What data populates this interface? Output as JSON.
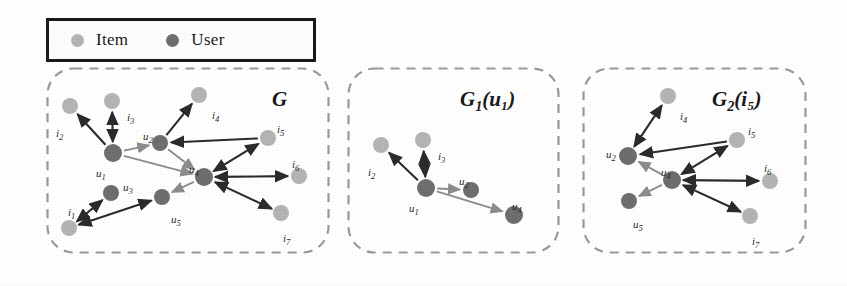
{
  "figure": {
    "type": "graph-diagram",
    "background": "#ffffff",
    "colors": {
      "item_node": "#b4b4b4",
      "user_node": "#6e6e6e",
      "edge": "#2b2b2b",
      "edge_light": "#8d8d8d",
      "panel_border": "#9a9a9a",
      "legend_border": "#1a1a1a",
      "text": "#1a1a1a"
    }
  },
  "legend": {
    "box": {
      "x": 46,
      "y": 18,
      "w": 270,
      "h": 44
    },
    "items": [
      {
        "label": "Item",
        "color_role": "item_node",
        "icon": "circle-icon",
        "dot_color": "#b4b4b4"
      },
      {
        "label": "User",
        "color_role": "user_node",
        "icon": "circle-icon",
        "dot_color": "#6e6e6e"
      }
    ]
  },
  "panels": [
    {
      "id": "panel-g",
      "title": {
        "main": "G",
        "sub": "",
        "paren": ""
      },
      "title_pos": {
        "x": 272,
        "y": 89,
        "size": 21
      },
      "box": {
        "x": 47,
        "y": 68,
        "w": 281,
        "h": 184
      },
      "nodes": [
        {
          "id": "i2",
          "type": "item",
          "label": "i",
          "sub": "2",
          "cx": 70,
          "cy": 106,
          "r": 8,
          "lx": 56,
          "ly": 128
        },
        {
          "id": "i3",
          "type": "item",
          "label": "i",
          "sub": "3",
          "cx": 112,
          "cy": 101,
          "r": 8,
          "lx": 127,
          "ly": 112
        },
        {
          "id": "i4",
          "type": "item",
          "label": "i",
          "sub": "4",
          "cx": 199,
          "cy": 95,
          "r": 8,
          "lx": 212,
          "ly": 110
        },
        {
          "id": "i5",
          "type": "item",
          "label": "i",
          "sub": "5",
          "cx": 268,
          "cy": 138,
          "r": 8,
          "lx": 277,
          "ly": 124
        },
        {
          "id": "i6",
          "type": "item",
          "label": "i",
          "sub": "6",
          "cx": 299,
          "cy": 176,
          "r": 8,
          "lx": 292,
          "ly": 159
        },
        {
          "id": "i7",
          "type": "item",
          "label": "i",
          "sub": "7",
          "cx": 281,
          "cy": 213,
          "r": 8,
          "lx": 283,
          "ly": 233
        },
        {
          "id": "i1",
          "type": "item",
          "label": "i",
          "sub": "1",
          "cx": 69,
          "cy": 228,
          "r": 8,
          "lx": 68,
          "ly": 207
        },
        {
          "id": "u1",
          "type": "user",
          "label": "u",
          "sub": "1",
          "cx": 113,
          "cy": 153,
          "r": 9,
          "lx": 96,
          "ly": 168
        },
        {
          "id": "u2",
          "type": "user",
          "label": "u",
          "sub": "2",
          "cx": 160,
          "cy": 143,
          "r": 8,
          "lx": 143,
          "ly": 131
        },
        {
          "id": "u3",
          "type": "user",
          "label": "u",
          "sub": "3",
          "cx": 111,
          "cy": 193,
          "r": 8,
          "lx": 123,
          "ly": 182
        },
        {
          "id": "u4",
          "type": "user",
          "label": "u",
          "sub": "4",
          "cx": 204,
          "cy": 177,
          "r": 9,
          "lx": 189,
          "ly": 164
        },
        {
          "id": "u5",
          "type": "user",
          "label": "u",
          "sub": "5",
          "cx": 162,
          "cy": 197,
          "r": 8,
          "lx": 171,
          "ly": 214
        }
      ],
      "edges": [
        {
          "from": "u1",
          "to": "i2",
          "dir": "forward",
          "tone": "dark"
        },
        {
          "from": "u1",
          "to": "i3",
          "dir": "both",
          "tone": "dark"
        },
        {
          "from": "u1",
          "to": "u2",
          "dir": "forward",
          "tone": "light"
        },
        {
          "from": "u1",
          "to": "u4",
          "dir": "forward",
          "tone": "light"
        },
        {
          "from": "u2",
          "to": "i4",
          "dir": "forward",
          "tone": "dark"
        },
        {
          "from": "i5",
          "to": "u2",
          "dir": "forward",
          "tone": "dark"
        },
        {
          "from": "u2",
          "to": "u4",
          "dir": "forward",
          "tone": "light"
        },
        {
          "from": "u4",
          "to": "i5",
          "dir": "both",
          "tone": "dark"
        },
        {
          "from": "u4",
          "to": "i6",
          "dir": "both",
          "tone": "dark"
        },
        {
          "from": "i7",
          "to": "u4",
          "dir": "both",
          "tone": "dark"
        },
        {
          "from": "u4",
          "to": "u5",
          "dir": "forward",
          "tone": "light"
        },
        {
          "from": "i1",
          "to": "u3",
          "dir": "both",
          "tone": "dark"
        },
        {
          "from": "i1",
          "to": "u5",
          "dir": "both",
          "tone": "dark"
        }
      ]
    },
    {
      "id": "panel-g1",
      "title": {
        "main": "G",
        "sub": "1",
        "paren": "(u₁)"
      },
      "title_pos": {
        "x": 460,
        "y": 89,
        "size": 21
      },
      "box": {
        "x": 348,
        "y": 68,
        "w": 210,
        "h": 184
      },
      "nodes": [
        {
          "id": "i2",
          "type": "item",
          "label": "i",
          "sub": "2",
          "cx": 381,
          "cy": 145,
          "r": 8,
          "lx": 368,
          "ly": 167
        },
        {
          "id": "i3",
          "type": "item",
          "label": "i",
          "sub": "3",
          "cx": 423,
          "cy": 140,
          "r": 8,
          "lx": 438,
          "ly": 151
        },
        {
          "id": "u1",
          "type": "user",
          "label": "u",
          "sub": "1",
          "cx": 426,
          "cy": 188,
          "r": 9,
          "lx": 409,
          "ly": 203
        },
        {
          "id": "u2",
          "type": "user",
          "label": "u",
          "sub": "2",
          "cx": 471,
          "cy": 190,
          "r": 8,
          "lx": 459,
          "ly": 176
        },
        {
          "id": "u4",
          "type": "user",
          "label": "u",
          "sub": "4",
          "cx": 514,
          "cy": 215,
          "r": 9,
          "lx": 512,
          "ly": 201
        }
      ],
      "edges": [
        {
          "from": "u1",
          "to": "i2",
          "dir": "forward",
          "tone": "dark"
        },
        {
          "from": "u1",
          "to": "i3",
          "dir": "both",
          "tone": "dark"
        },
        {
          "from": "u1",
          "to": "u2",
          "dir": "forward",
          "tone": "light"
        },
        {
          "from": "u1",
          "to": "u4",
          "dir": "forward",
          "tone": "light"
        }
      ]
    },
    {
      "id": "panel-g2",
      "title": {
        "main": "G",
        "sub": "2",
        "paren": "(i₅)"
      },
      "title_pos": {
        "x": 712,
        "y": 89,
        "size": 21
      },
      "box": {
        "x": 583,
        "y": 68,
        "w": 222,
        "h": 184
      },
      "nodes": [
        {
          "id": "i4",
          "type": "item",
          "label": "i",
          "sub": "4",
          "cx": 668,
          "cy": 96,
          "r": 8,
          "lx": 680,
          "ly": 111
        },
        {
          "id": "i5",
          "type": "item",
          "label": "i",
          "sub": "5",
          "cx": 737,
          "cy": 140,
          "r": 8,
          "lx": 748,
          "ly": 126
        },
        {
          "id": "i6",
          "type": "item",
          "label": "i",
          "sub": "6",
          "cx": 770,
          "cy": 181,
          "r": 8,
          "lx": 764,
          "ly": 163
        },
        {
          "id": "i7",
          "type": "item",
          "label": "i",
          "sub": "7",
          "cx": 750,
          "cy": 216,
          "r": 8,
          "lx": 752,
          "ly": 236
        },
        {
          "id": "u2",
          "type": "user",
          "label": "u",
          "sub": "2",
          "cx": 628,
          "cy": 156,
          "r": 9,
          "lx": 606,
          "ly": 149
        },
        {
          "id": "u4",
          "type": "user",
          "label": "u",
          "sub": "4",
          "cx": 672,
          "cy": 180,
          "r": 9,
          "lx": 661,
          "ly": 167
        },
        {
          "id": "u5",
          "type": "user",
          "label": "u",
          "sub": "5",
          "cx": 629,
          "cy": 201,
          "r": 8,
          "lx": 633,
          "ly": 219
        }
      ],
      "edges": [
        {
          "from": "u2",
          "to": "i4",
          "dir": "both",
          "tone": "dark"
        },
        {
          "from": "i5",
          "to": "u2",
          "dir": "forward",
          "tone": "dark"
        },
        {
          "from": "u4",
          "to": "i5",
          "dir": "both",
          "tone": "dark"
        },
        {
          "from": "u4",
          "to": "i6",
          "dir": "both",
          "tone": "dark"
        },
        {
          "from": "i7",
          "to": "u4",
          "dir": "both",
          "tone": "dark"
        },
        {
          "from": "u4",
          "to": "u2",
          "dir": "forward",
          "tone": "light"
        },
        {
          "from": "u4",
          "to": "u5",
          "dir": "forward",
          "tone": "light"
        }
      ]
    }
  ]
}
